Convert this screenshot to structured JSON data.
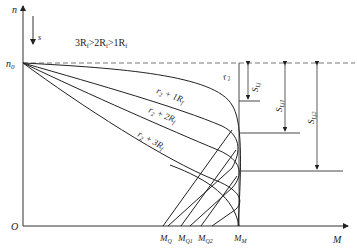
{
  "diagram": {
    "type": "motor mechanical characteristic (n-M) with rotor resistance",
    "axes": {
      "y_label": "n",
      "x_label": "M",
      "origin_label": "O",
      "slip_label": "s",
      "n0_label": "n",
      "n0_sub": "0"
    },
    "condition": {
      "text_parts": [
        "3R",
        "f",
        ">2R",
        "f",
        ">1R",
        "f"
      ]
    },
    "curves": [
      {
        "name": "r2",
        "label_main": "r",
        "label_sub": "2",
        "label_rest": ""
      },
      {
        "name": "r2+1Rf",
        "label_main": "r",
        "label_sub": "2",
        "label_rest": " + 1R",
        "label_rest_sub": "f"
      },
      {
        "name": "r2+2Rf",
        "label_main": "r",
        "label_sub": "2",
        "label_rest": " + 2R",
        "label_rest_sub": "f"
      },
      {
        "name": "r2+3Rf",
        "label_main": "r",
        "label_sub": "2",
        "label_rest": " + 3R",
        "label_rest_sub": "f"
      }
    ],
    "slip_markers": [
      {
        "main": "S",
        "sub": "Lj"
      },
      {
        "main": "S",
        "sub": "Lj1"
      },
      {
        "main": "S",
        "sub": "Lj2"
      }
    ],
    "x_ticks": [
      {
        "main": "M",
        "sub": "Q"
      },
      {
        "main": "M",
        "sub": "Q1"
      },
      {
        "main": "M",
        "sub": "Q2"
      },
      {
        "main": "M",
        "sub": "M"
      }
    ]
  }
}
